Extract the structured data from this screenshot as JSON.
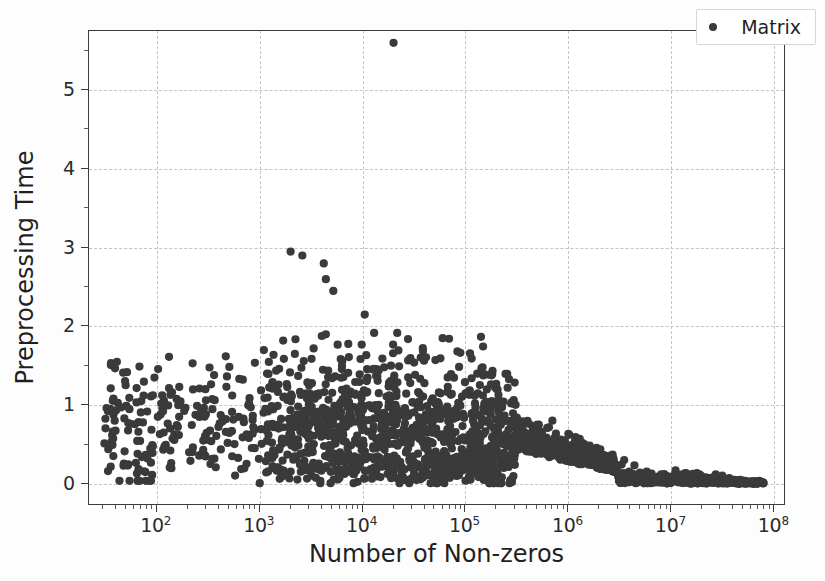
{
  "figure": {
    "background_color": "#fdfdfd",
    "plot_background_color": "#ffffff",
    "frame_color": "#3b3b3b",
    "grid_color": "#c3c3c8",
    "point_color": "#3a3a3a"
  },
  "legend": {
    "entries": [
      {
        "label": "Matrix",
        "marker": "circle-marker-icon",
        "color": "#3a3a3a"
      }
    ]
  },
  "axes": {
    "x_title": "Number of Non-zeros",
    "y_title": "Preprocessing Time",
    "x_tick_labels": [
      "10",
      "10",
      "10",
      "10",
      "10",
      "10",
      "10"
    ],
    "x_tick_exponents": [
      "2",
      "3",
      "4",
      "5",
      "6",
      "7",
      "8"
    ],
    "y_tick_labels": [
      "0",
      "1",
      "2",
      "3",
      "4",
      "5"
    ]
  },
  "chart_data": {
    "type": "scatter",
    "title": "",
    "xlabel": "Number of Non-zeros",
    "ylabel": "Preprocessing Time",
    "xscale": "log",
    "yscale": "linear",
    "xlim": [
      22,
      130000000
    ],
    "ylim": [
      -0.28,
      5.75
    ],
    "xticks": [
      100,
      1000,
      10000,
      100000,
      1000000,
      10000000,
      100000000
    ],
    "xticklabels": [
      "10^2",
      "10^3",
      "10^4",
      "10^5",
      "10^6",
      "10^7",
      "10^8"
    ],
    "yticks": [
      0,
      1,
      2,
      3,
      4,
      5
    ],
    "yticklabels": [
      "0",
      "1",
      "2",
      "3",
      "4",
      "5"
    ],
    "grid": true,
    "grid_style": "dashed",
    "legend_position": "upper right",
    "marker": "circle",
    "marker_size": 8,
    "marker_color": "#3a3a3a",
    "series": [
      {
        "name": "Matrix",
        "n_points_approx": 2200,
        "notable_points": [
          {
            "x": 20000,
            "y": 5.6,
            "note": "global maximum outlier"
          },
          {
            "x": 2000,
            "y": 2.95
          },
          {
            "x": 2600,
            "y": 2.9
          },
          {
            "x": 4200,
            "y": 2.8
          },
          {
            "x": 4400,
            "y": 2.6
          },
          {
            "x": 5200,
            "y": 2.45
          },
          {
            "x": 10500,
            "y": 2.15
          },
          {
            "x": 4400,
            "y": 1.9
          },
          {
            "x": 60000,
            "y": 1.85
          },
          {
            "x": 1100,
            "y": 1.7
          },
          {
            "x": 2200,
            "y": 1.65
          },
          {
            "x": 130000,
            "y": 1.4
          },
          {
            "x": 900000,
            "y": 0.5
          },
          {
            "x": 60000000,
            "y": 0.02
          }
        ],
        "distribution_description": "Dense cloud spanning 3e1 to 8e7 on log x. Sparse scattered points from 3e1 to 1e3 mostly between y=0.1 and y=1.6. Densest concentration between 1e3 and 1e6 with y between 0.05 and 1.4, centered near y=0.7. Beyond 1e6 the cloud collapses toward y=0, forming a thin tail hugging y=0.0-0.1 out to 8e7.",
        "x_range": [
          30,
          80000000
        ],
        "y_range": [
          0.0,
          5.6
        ],
        "y_median_approx": 0.6
      }
    ]
  }
}
